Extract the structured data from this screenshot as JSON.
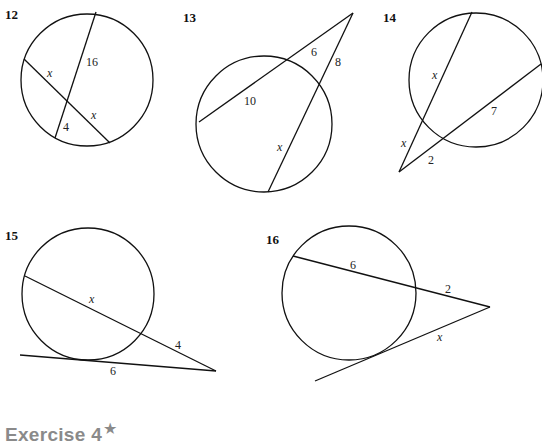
{
  "exercises": [
    {
      "number": "12",
      "type": "two-intersecting-chords",
      "labels": [
        "x",
        "16",
        "4",
        "x"
      ]
    },
    {
      "number": "13",
      "type": "two-secants-from-external-point",
      "labels": [
        "6",
        "8",
        "10",
        "x"
      ]
    },
    {
      "number": "14",
      "type": "two-secants-from-external-point",
      "labels": [
        "x",
        "x",
        "7",
        "2"
      ]
    },
    {
      "number": "15",
      "type": "tangent-and-secant",
      "labels": [
        "x",
        "4",
        "6"
      ]
    },
    {
      "number": "16",
      "type": "tangent-and-secant",
      "labels": [
        "6",
        "2",
        "x"
      ]
    }
  ],
  "section_heading": {
    "text": "Exercise 4",
    "star": "★"
  }
}
